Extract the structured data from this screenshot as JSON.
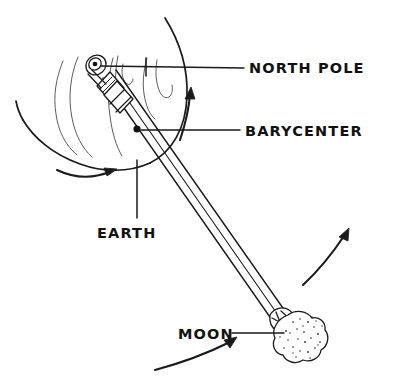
{
  "diagram": {
    "background_color": "#ffffff",
    "ink_color": "#1a1a1a",
    "style": "hand-drawn pen sketch",
    "width": 401,
    "height": 390
  },
  "labels": {
    "north_pole": "NORTH POLE",
    "barycenter": "BARYCENTER",
    "earth": "EARTH",
    "moon": "MOON"
  },
  "objects": {
    "earth": {
      "name": "Earth",
      "shape": "large circle with wavy meridian lines",
      "center_x": 128,
      "center_y": 108,
      "radius": 100
    },
    "moon": {
      "name": "Moon",
      "shape": "lumpy stippled blob",
      "center_x": 297,
      "center_y": 338,
      "radius": 25
    },
    "axis_rod": {
      "name": "axis rod",
      "description": "three-line tapered shaft from Earth north pole to Moon",
      "from_x": 96,
      "from_y": 64,
      "to_x": 281,
      "to_y": 318
    },
    "barycenter_dot": {
      "name": "barycenter point",
      "x": 137,
      "y": 129
    },
    "pole_knob": {
      "name": "north pole knob",
      "x": 96,
      "y": 64
    }
  },
  "arrows": [
    {
      "name": "earth-rotation-arrow",
      "direction": "right",
      "position": "below Earth"
    },
    {
      "name": "barycenter-orbit-arrow",
      "direction": "up",
      "position": "right of Earth"
    },
    {
      "name": "moon-orbit-arrow",
      "direction": "up-right",
      "position": "right of center"
    },
    {
      "name": "moon-motion-arrow",
      "direction": "up-right",
      "position": "below Moon label"
    }
  ],
  "leader_lines": [
    {
      "name": "north-pole-leader",
      "from": "pole knob",
      "to": "NORTH POLE label"
    },
    {
      "name": "barycenter-leader",
      "from": "barycenter dot",
      "to": "BARYCENTER label"
    },
    {
      "name": "earth-leader",
      "from": "Earth edge",
      "to": "EARTH label"
    },
    {
      "name": "moon-leader",
      "from": "MOON label",
      "to": "Moon blob"
    }
  ]
}
